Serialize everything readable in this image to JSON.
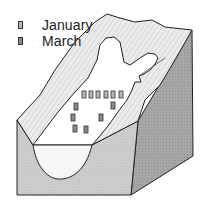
{
  "diagram": {
    "legend": [
      {
        "label": "January",
        "swatch_color": "#b8b8b8"
      },
      {
        "label": "March",
        "swatch_color": "#8a8a8a"
      }
    ],
    "colors": {
      "outline": "#222222",
      "front_face": "#cfcfcf",
      "right_face": "#a9a9a9",
      "valley_slope": "#e6e6e6",
      "glacier": "#ffffff",
      "ice_section": "#f7f7f7",
      "stake_january": "#b8b8b8",
      "stake_march": "#8a8a8a"
    },
    "stakes": {
      "january": [
        {
          "x": 84,
          "y": 94
        },
        {
          "x": 91,
          "y": 94
        },
        {
          "x": 98,
          "y": 94
        },
        {
          "x": 106,
          "y": 94
        },
        {
          "x": 113,
          "y": 94
        },
        {
          "x": 121,
          "y": 94
        }
      ],
      "march": [
        {
          "x": 76,
          "y": 106
        },
        {
          "x": 113,
          "y": 105
        },
        {
          "x": 73,
          "y": 117
        },
        {
          "x": 101,
          "y": 117
        },
        {
          "x": 75,
          "y": 128
        },
        {
          "x": 86,
          "y": 129
        }
      ]
    }
  }
}
